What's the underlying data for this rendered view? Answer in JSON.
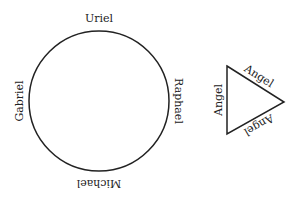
{
  "circle_diagram": {
    "labels": {
      "top": "Uriel",
      "right": "Raphael",
      "bottom": "Michael",
      "left": "Gabriel"
    }
  },
  "triangle_diagram": {
    "labels": {
      "left": "Angel",
      "upper": "Angel",
      "lower": "Angel"
    }
  },
  "colors": {
    "stroke": "#222222",
    "background": "#ffffff"
  }
}
